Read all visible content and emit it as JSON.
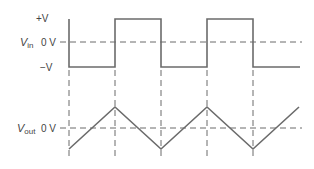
{
  "diagram": {
    "vin": {
      "name": "V",
      "subscript": "in",
      "levels": {
        "high": "+V",
        "zero": "0 V",
        "low": "−V"
      }
    },
    "vout": {
      "name": "V",
      "subscript": "out",
      "levels": {
        "zero": "0 V"
      }
    },
    "colors": {
      "signal": "#6b6b6b",
      "dashed": "#6b6b6b",
      "text": "#444444"
    },
    "waveforms": {
      "vin_type": "square",
      "vout_type": "triangle",
      "transitions_x": [
        115,
        161,
        207,
        253
      ]
    }
  }
}
